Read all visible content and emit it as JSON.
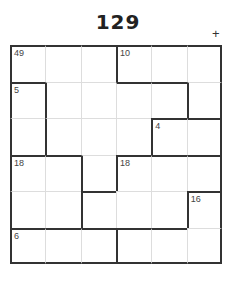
{
  "puzzle": {
    "title": "129",
    "zoom_button": "+",
    "size": 6,
    "cages": [
      {
        "sum": 49,
        "cells": [
          [
            0,
            0
          ],
          [
            0,
            1
          ],
          [
            0,
            2
          ],
          [
            1,
            1
          ],
          [
            1,
            2
          ],
          [
            1,
            3
          ],
          [
            1,
            4
          ],
          [
            2,
            1
          ],
          [
            2,
            2
          ],
          [
            2,
            3
          ],
          [
            3,
            2
          ]
        ]
      },
      {
        "sum": 10,
        "cells": [
          [
            0,
            3
          ],
          [
            0,
            4
          ],
          [
            0,
            5
          ],
          [
            1,
            5
          ]
        ]
      },
      {
        "sum": 5,
        "cells": [
          [
            1,
            0
          ],
          [
            2,
            0
          ]
        ]
      },
      {
        "sum": 4,
        "cells": [
          [
            2,
            4
          ],
          [
            2,
            5
          ]
        ]
      },
      {
        "sum": 18,
        "cells": [
          [
            3,
            0
          ],
          [
            3,
            1
          ],
          [
            4,
            0
          ],
          [
            4,
            1
          ]
        ]
      },
      {
        "sum": 18,
        "cells": [
          [
            3,
            3
          ],
          [
            3,
            4
          ],
          [
            3,
            5
          ],
          [
            4,
            2
          ],
          [
            4,
            3
          ],
          [
            4,
            4
          ]
        ]
      },
      {
        "sum": 16,
        "cells": [
          [
            4,
            5
          ],
          [
            5,
            3
          ],
          [
            5,
            4
          ],
          [
            5,
            5
          ]
        ]
      },
      {
        "sum": 6,
        "cells": [
          [
            5,
            0
          ],
          [
            5,
            1
          ],
          [
            5,
            2
          ]
        ]
      }
    ]
  }
}
